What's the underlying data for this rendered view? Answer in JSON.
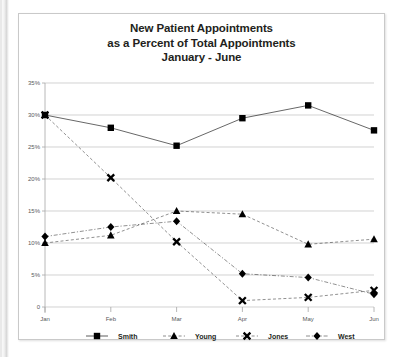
{
  "chart_data": {
    "type": "line",
    "title": "New Patient Appointments\nas a Percent of Total Appointments\nJanuary - June",
    "title_lines": [
      "New Patient Appointments",
      "as a Percent of Total Appointments",
      "January - June"
    ],
    "xlabel": "",
    "ylabel": "",
    "categories": [
      "Jan",
      "Feb",
      "Mar",
      "Apr",
      "May",
      "Jun"
    ],
    "x": [
      "Jan",
      "Feb",
      "Mar",
      "Apr",
      "May",
      "Jun"
    ],
    "ylim": [
      0,
      35
    ],
    "ytick_values": [
      0,
      5,
      10,
      15,
      20,
      25,
      30,
      35
    ],
    "ytick_labels": [
      "0",
      "5%",
      "10%",
      "15%",
      "20%",
      "25%",
      "30%",
      "35%"
    ],
    "grid": true,
    "legend_position": "bottom",
    "series": [
      {
        "name": "Smith",
        "marker": "square",
        "linestyle": "solid",
        "color": "#000000",
        "values": [
          30.0,
          28.0,
          25.2,
          29.5,
          31.5,
          27.6
        ]
      },
      {
        "name": "Young",
        "marker": "triangle",
        "linestyle": "dashed",
        "color": "#000000",
        "values": [
          10.0,
          11.2,
          15.0,
          14.5,
          9.8,
          10.6
        ]
      },
      {
        "name": "Jones",
        "marker": "x",
        "linestyle": "dashed",
        "color": "#000000",
        "values": [
          30.0,
          20.2,
          10.2,
          1.0,
          1.5,
          2.6
        ]
      },
      {
        "name": "West",
        "marker": "diamond",
        "linestyle": "dash-dot",
        "color": "#000000",
        "values": [
          11.0,
          12.5,
          13.4,
          5.2,
          4.6,
          2.0
        ]
      }
    ]
  },
  "legend": {
    "items": [
      {
        "label": "Smith",
        "marker": "square"
      },
      {
        "label": "Young",
        "marker": "triangle"
      },
      {
        "label": "Jones",
        "marker": "x"
      },
      {
        "label": "West",
        "marker": "diamond"
      }
    ]
  },
  "colors": {
    "ink": "#000000",
    "grid": "#bfbfbf",
    "axis": "#a6a6a6",
    "tick_text": "#58595b",
    "card_border": "#c9c9c9",
    "background": "#ffffff"
  }
}
